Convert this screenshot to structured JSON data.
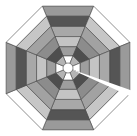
{
  "diagram": {
    "type": "octagonal-concentric-ring-diagram",
    "center": [
      68,
      68
    ],
    "outer_radius": 67,
    "sectors": 8,
    "ring_radii": [
      67,
      56,
      45,
      34,
      23,
      13
    ],
    "center_circle_radius": 5,
    "colors": {
      "white": "#ffffff",
      "light": "#c8c8c8",
      "medium_light": "#acacac",
      "medium": "#909090",
      "dark": "#555555",
      "outline": "#444444"
    },
    "cardinal_ring_fills": [
      "#9a9a9a",
      "#555555",
      "#a8a8a8",
      "#c4c4c4",
      "#9e9e9e",
      "#ffffff"
    ],
    "diagonal_ring_fills": [
      "#ffffff",
      "#c6c6c6",
      "#a2a2a2",
      "#8c8c8c",
      "#4e4e4e",
      "#b4b4b4"
    ],
    "cut_wedge": {
      "from_center": true,
      "angle_deg": 22,
      "width_deg": 5,
      "color": "#ffffff"
    }
  }
}
